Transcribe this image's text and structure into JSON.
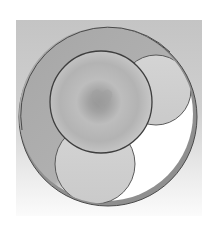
{
  "figure": {
    "colors": {
      "backdrop_top": "#c4c4c4",
      "backdrop_bottom": "#fbfbfb",
      "cavity_shadow": "#a9a9a9",
      "cavity_light": "#ffffff",
      "ring_band": "#8f8f8f",
      "outline": "#4a4a4a",
      "large_sphere_center": "#9a9a9a",
      "large_sphere_edge": "#c8c8c8",
      "small_sphere_fill": "#cfcfcf"
    },
    "outer_ring": {
      "cx": 108,
      "cy": 117,
      "r": 89
    },
    "large_sphere": {
      "cx": 101,
      "cy": 102,
      "r": 51
    },
    "small_sphere_upper_right": {
      "cx": 156,
      "cy": 90,
      "r": 35
    },
    "small_sphere_lower": {
      "cx": 95,
      "cy": 164,
      "r": 40
    }
  }
}
